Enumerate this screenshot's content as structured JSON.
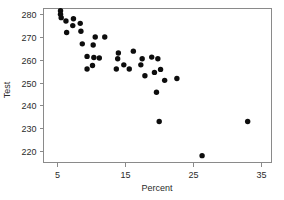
{
  "chart_data": {
    "type": "scatter",
    "title": "",
    "xlabel": "Percent",
    "ylabel": "Test",
    "xlim": [
      3.0,
      36.5
    ],
    "ylim": [
      215.0,
      282.5
    ],
    "xticks": [
      5,
      15,
      25,
      35
    ],
    "yticks": [
      220,
      230,
      240,
      250,
      260,
      270,
      280
    ],
    "grid": false,
    "legend": null,
    "marker": "filled-circle",
    "marker_color": "#0d0d0d",
    "points": [
      {
        "x": 5.5,
        "y": 281.5
      },
      {
        "x": 5.5,
        "y": 280.0
      },
      {
        "x": 5.6,
        "y": 278.5
      },
      {
        "x": 6.3,
        "y": 277.0
      },
      {
        "x": 7.4,
        "y": 278.0
      },
      {
        "x": 6.4,
        "y": 272.0
      },
      {
        "x": 7.3,
        "y": 275.0
      },
      {
        "x": 8.4,
        "y": 276.0
      },
      {
        "x": 8.5,
        "y": 272.5
      },
      {
        "x": 8.7,
        "y": 267.0
      },
      {
        "x": 10.6,
        "y": 270.0
      },
      {
        "x": 12.0,
        "y": 270.0
      },
      {
        "x": 10.3,
        "y": 266.5
      },
      {
        "x": 9.4,
        "y": 261.5
      },
      {
        "x": 10.4,
        "y": 261.0
      },
      {
        "x": 11.2,
        "y": 260.8
      },
      {
        "x": 9.4,
        "y": 256.0
      },
      {
        "x": 10.2,
        "y": 257.5
      },
      {
        "x": 14.0,
        "y": 263.0
      },
      {
        "x": 16.2,
        "y": 263.8
      },
      {
        "x": 13.9,
        "y": 260.5
      },
      {
        "x": 13.7,
        "y": 256.0
      },
      {
        "x": 14.8,
        "y": 257.8
      },
      {
        "x": 15.6,
        "y": 256.0
      },
      {
        "x": 17.3,
        "y": 257.8
      },
      {
        "x": 17.5,
        "y": 260.5
      },
      {
        "x": 18.9,
        "y": 261.2
      },
      {
        "x": 19.8,
        "y": 260.5
      },
      {
        "x": 17.9,
        "y": 253.0
      },
      {
        "x": 19.3,
        "y": 254.5
      },
      {
        "x": 20.2,
        "y": 255.8
      },
      {
        "x": 20.8,
        "y": 251.0
      },
      {
        "x": 22.6,
        "y": 251.8
      },
      {
        "x": 19.6,
        "y": 245.8
      },
      {
        "x": 20.0,
        "y": 233.0
      },
      {
        "x": 33.0,
        "y": 233.0
      },
      {
        "x": 26.3,
        "y": 218.0
      }
    ]
  }
}
